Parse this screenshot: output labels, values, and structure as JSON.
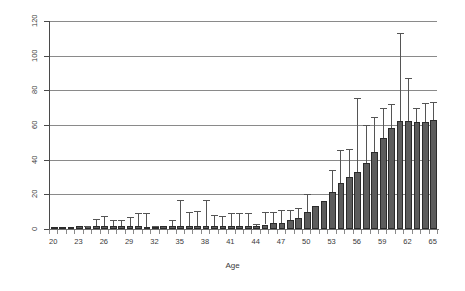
{
  "chart": {
    "type": "bar",
    "x_axis_title": "Age",
    "y_axis_title": "",
    "title": ""
  },
  "colors": {
    "bar_fill": "#5c5c5c",
    "bar_stroke": "#2b2b2b",
    "gridline": "#8a8a8a",
    "axis": "#4a4a4a",
    "error_bar": "#555555",
    "background": "#ffffff",
    "text": "#3a3a3a"
  },
  "chart_data": {
    "type": "bar",
    "title": "",
    "xlabel": "Age",
    "ylabel": "",
    "xlim": [
      19.5,
      65.5
    ],
    "ylim": [
      0,
      120
    ],
    "yticks": [
      0,
      20,
      40,
      60,
      80,
      100,
      120
    ],
    "ytick_labels": [
      "0",
      "20",
      "40",
      "60",
      "80",
      "100",
      "120"
    ],
    "xticks": [
      20,
      23,
      26,
      29,
      32,
      35,
      38,
      41,
      44,
      47,
      50,
      53,
      56,
      59,
      62,
      65
    ],
    "xtick_labels": [
      "20",
      "23",
      "26",
      "29",
      "32",
      "35",
      "38",
      "41",
      "44",
      "47",
      "50",
      "53",
      "56",
      "59",
      "62",
      "65"
    ],
    "grid": true,
    "grid_axis": "y",
    "legend": false,
    "error_bars": true,
    "error_bar_style": "upper-only-with-caps",
    "categories": [
      20,
      21,
      22,
      23,
      24,
      25,
      26,
      27,
      28,
      29,
      30,
      31,
      32,
      33,
      34,
      35,
      36,
      37,
      38,
      39,
      40,
      41,
      42,
      43,
      44,
      45,
      46,
      47,
      48,
      49,
      50,
      51,
      52,
      53,
      54,
      55,
      56,
      57,
      58,
      59,
      60,
      61,
      62,
      63,
      64,
      65
    ],
    "values": [
      0.6,
      1.0,
      1.2,
      1.6,
      1.5,
      1.8,
      1.8,
      2.0,
      2.0,
      1.9,
      1.7,
      1.3,
      1.3,
      1.5,
      1.6,
      1.6,
      1.8,
      1.8,
      2.0,
      1.7,
      1.6,
      1.6,
      1.6,
      1.7,
      1.8,
      2.6,
      3.2,
      3.5,
      5.0,
      6.5,
      9.6,
      13.5,
      16.0,
      21.5,
      26.5,
      30.0,
      33.0,
      38.0,
      44.5,
      52.5,
      58.0,
      62.5,
      62.5,
      62.0,
      62.0,
      63.0
    ],
    "error_upper": [
      0.6,
      1.0,
      1.2,
      1.6,
      2.0,
      6.0,
      7.6,
      5.0,
      5.2,
      7.0,
      9.0,
      9.0,
      2.0,
      1.8,
      5.0,
      17.0,
      10.0,
      10.5,
      16.5,
      8.0,
      7.6,
      9.5,
      9.2,
      9.2,
      3.0,
      10.0,
      10.0,
      11.0,
      11.0,
      12.0,
      20.0,
      13.5,
      16.0,
      34.0,
      45.5,
      46.0,
      75.5,
      60.0,
      64.5,
      70.0,
      72.0,
      113.0,
      87.0,
      70.0,
      72.5,
      73.5
    ],
    "series": [
      {
        "name": "count",
        "values": [
          0.6,
          1.0,
          1.2,
          1.6,
          1.5,
          1.8,
          1.8,
          2.0,
          2.0,
          1.9,
          1.7,
          1.3,
          1.3,
          1.5,
          1.6,
          1.6,
          1.8,
          1.8,
          2.0,
          1.7,
          1.6,
          1.6,
          1.6,
          1.7,
          1.8,
          2.6,
          3.2,
          3.5,
          5.0,
          6.5,
          9.6,
          13.5,
          16.0,
          21.5,
          26.5,
          30.0,
          33.0,
          38.0,
          44.5,
          52.5,
          58.0,
          62.5,
          62.5,
          62.0,
          62.0,
          63.0
        ]
      }
    ]
  }
}
